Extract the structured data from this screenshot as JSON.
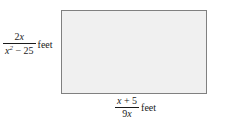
{
  "figure": {
    "type": "rectangle-with-dimension-labels",
    "shape": {
      "name": "rectangle",
      "fill_color": "#f0f0f0",
      "border_color": "#808080"
    },
    "height_label": {
      "numerator": "2x",
      "denominator": "x² − 25",
      "unit": "feet",
      "numerator_parts": {
        "coefficient": "2",
        "variable": "x"
      },
      "denominator_parts": {
        "variable": "x",
        "exponent": "2",
        "operator": "−",
        "constant": "25"
      }
    },
    "width_label": {
      "numerator": "x + 5",
      "denominator": "9x",
      "unit": "feet",
      "numerator_parts": {
        "variable": "x",
        "operator": "+",
        "constant": "5"
      },
      "denominator_parts": {
        "coefficient": "9",
        "variable": "x"
      }
    }
  }
}
